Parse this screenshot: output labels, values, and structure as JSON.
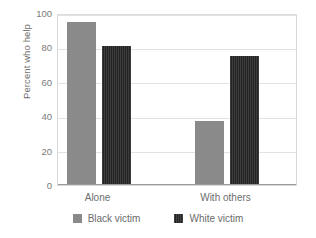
{
  "chart_data": {
    "type": "bar",
    "title": "",
    "subtitle": "",
    "xlabel": "",
    "ylabel": "Percent who help",
    "categories": [
      "Alone",
      "With others"
    ],
    "series": [
      {
        "name": "Black victim",
        "color": "#8a8a8a",
        "values": [
          95,
          37.5
        ]
      },
      {
        "name": "White victim",
        "color": "#242424",
        "values": [
          81,
          75
        ]
      }
    ],
    "ylim": [
      0,
      100
    ],
    "yticks": [
      0,
      20,
      40,
      60,
      80,
      100
    ],
    "ytick_labels": [
      "0",
      "20",
      "40",
      "60",
      "80",
      "100"
    ],
    "grid": true,
    "grid_axis": "y",
    "legend_position": "bottom",
    "legend_entries": [
      "Black victim",
      "White victim"
    ],
    "background_color": "#ffffff",
    "gridline_color": "#e2e2e2",
    "axis_color": "#9a9a9a",
    "text_color": "#6e6e6e"
  }
}
